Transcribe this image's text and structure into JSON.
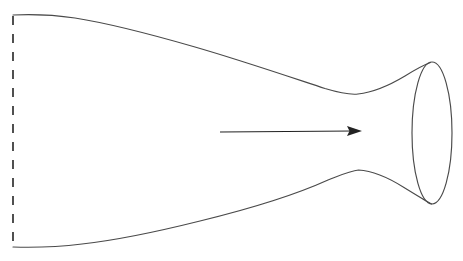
{
  "figure": {
    "background_color": "#ffffff",
    "width": 463,
    "height": 261,
    "line_color": "#4a4a4a",
    "arrow_color": "#222222",
    "axis_color": "#3d3d3d"
  },
  "chart_data": {
    "type": "line",
    "xlabel": "",
    "ylabel": "",
    "xlim": [
      0,
      463
    ],
    "ylim": [
      261,
      0
    ],
    "grid": false,
    "legend": "none",
    "annotations": [
      {
        "name": "flow-direction-arrow",
        "type": "arrow",
        "x_start": 220,
        "y_start": 132,
        "x_end": 362,
        "y_end": 131
      },
      {
        "name": "inlet-axis-dashed-line",
        "type": "dashed-vertical-line",
        "x": 13,
        "y_start": 16,
        "y_end": 244
      }
    ],
    "series": [
      {
        "name": "upper-wall-contour",
        "x": [
          13,
          40,
          70,
          105,
          140,
          175,
          210,
          245,
          275,
          300,
          325,
          345,
          358,
          375,
          395,
          412,
          430
        ],
        "y": [
          15,
          15,
          17,
          22,
          29,
          39,
          50,
          62,
          72,
          80,
          88,
          92,
          94,
          92,
          85,
          75,
          63
        ]
      },
      {
        "name": "lower-wall-contour",
        "x": [
          13,
          45,
          75,
          110,
          145,
          180,
          215,
          250,
          280,
          305,
          328,
          347,
          358,
          375,
          395,
          413,
          431
        ],
        "y": [
          247,
          247,
          245,
          241,
          236,
          228,
          218,
          206,
          197,
          189,
          180,
          174,
          170,
          172,
          179,
          189,
          204
        ]
      },
      {
        "name": "exit-plane-ellipse",
        "type": "ellipse",
        "cx": 432,
        "cy": 133,
        "rx": 20,
        "ry": 71
      }
    ]
  },
  "elements": {
    "upper_wall_label": "upper nozzle wall",
    "lower_wall_label": "lower nozzle wall",
    "exit_ellipse_label": "nozzle exit plane",
    "throat_label": "nozzle throat",
    "arrow_label": "flow direction",
    "axis_label": "inlet plane"
  }
}
